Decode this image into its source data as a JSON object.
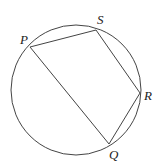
{
  "diagram": {
    "type": "cyclic-quadrilateral",
    "circle": {
      "cx": 76,
      "cy": 90,
      "r": 65
    },
    "points": {
      "P": {
        "label": "P",
        "x": 30,
        "y": 47,
        "lx": 20,
        "ly": 44
      },
      "S": {
        "label": "S",
        "x": 96,
        "y": 30,
        "lx": 97,
        "ly": 24
      },
      "R": {
        "label": "R",
        "x": 140,
        "y": 93,
        "lx": 144,
        "ly": 100
      },
      "Q": {
        "label": "Q",
        "x": 109,
        "y": 144,
        "lx": 109,
        "ly": 159
      }
    },
    "segments": [
      "PS",
      "SR",
      "RQ",
      "QP"
    ],
    "stroke_color": "#444444"
  }
}
